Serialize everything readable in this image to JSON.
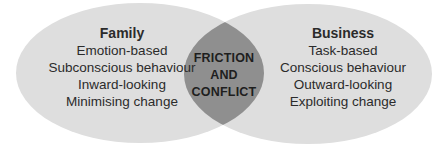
{
  "diagram": {
    "type": "venn",
    "colors": {
      "circle_fill": "#dedede",
      "overlap_fill": "#8f8f8f",
      "text": "#2b2b2b",
      "background": "#ffffff"
    },
    "left": {
      "title": "Family",
      "items": [
        "Emotion-based",
        "Subconscious behaviour",
        "Inward-looking",
        "Minimising change"
      ]
    },
    "right": {
      "title": "Business",
      "items": [
        "Task-based",
        "Conscious behaviour",
        "Outward-looking",
        "Exploiting change"
      ]
    },
    "overlap": {
      "lines": [
        "FRICTION",
        "AND",
        "CONFLICT"
      ]
    }
  }
}
